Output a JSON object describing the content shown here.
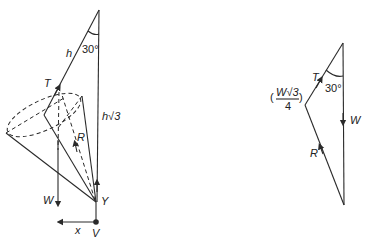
{
  "figure_left": {
    "title": "Cone suspended by string",
    "labels": {
      "string_length": "h",
      "angle": "30°",
      "vertical_height": "h√3",
      "tension": "T",
      "reaction": "R",
      "weight": "W",
      "vertical_reaction": "Y",
      "horizontal_reaction": "x",
      "vertex": "V"
    }
  },
  "figure_right": {
    "title": "Triangle of forces",
    "labels": {
      "tension": "T",
      "angle": "30°",
      "weight": "W",
      "reaction": "R",
      "tension_value_num": "W√3",
      "tension_value_den": "4"
    }
  },
  "colors": {
    "line": "#2a2a2a",
    "background": "#ffffff"
  }
}
